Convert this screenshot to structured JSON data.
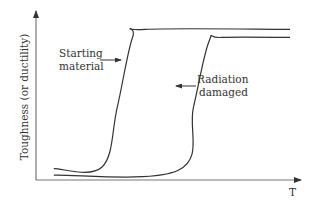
{
  "chart_data": {
    "type": "line",
    "title": "",
    "xlabel": "T",
    "ylabel": "Toughness (or ductility)",
    "xlim": [
      0,
      100
    ],
    "ylim": [
      0,
      100
    ],
    "grid": false,
    "legend": "none",
    "colors": {
      "axis": "#777777",
      "curve": "#333333",
      "text": "#333333"
    },
    "series": [
      {
        "name": "Starting material",
        "annotation": [
          "Starting",
          "material"
        ],
        "points": [
          [
            7,
            7
          ],
          [
            26,
            8
          ],
          [
            32,
            45
          ],
          [
            38,
            88
          ],
          [
            43,
            93
          ],
          [
            100,
            93
          ]
        ]
      },
      {
        "name": "Radiation damaged",
        "annotation": [
          "Radiation",
          "damaged"
        ],
        "points": [
          [
            7,
            3
          ],
          [
            56,
            6
          ],
          [
            62,
            45
          ],
          [
            68,
            85
          ],
          [
            73,
            88
          ],
          [
            100,
            88
          ]
        ]
      }
    ]
  }
}
